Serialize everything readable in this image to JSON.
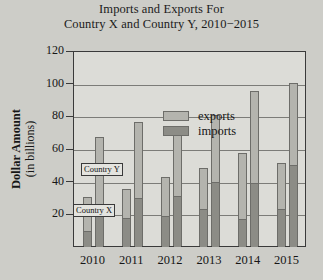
{
  "chart_data": {
    "type": "bar",
    "subtype": "grouped-stacked",
    "title_line1": "Imports and Exports For",
    "title_line2": "Country X and Country Y, 2010−2015",
    "xlabel": "",
    "ylabel": "Dollar Amount (in billions)",
    "ylabel_line1": "Dollar Amount",
    "ylabel_line2": "(in billions)",
    "categories": [
      "2010",
      "2011",
      "2012",
      "2013",
      "2014",
      "2015"
    ],
    "ylim": [
      0,
      120
    ],
    "yticks": [
      20,
      40,
      60,
      80,
      100,
      120
    ],
    "ytick_labels": [
      "20",
      "40",
      "60",
      "80",
      "100",
      "120"
    ],
    "grid": true,
    "legend_position": "upper-left-inside",
    "legend": [
      "exports",
      "imports"
    ],
    "annotations": [
      "Country Y",
      "Country X"
    ],
    "series": [
      {
        "name": "Country X imports",
        "country": "Country X",
        "component": "imports",
        "color": "#8c8c86",
        "values": [
          10,
          18,
          19,
          23,
          17,
          23
        ]
      },
      {
        "name": "Country X exports",
        "country": "Country X",
        "component": "exports",
        "color": "#b4b4ae",
        "values": [
          20,
          17,
          23,
          25,
          40,
          28
        ]
      },
      {
        "name": "Country Y imports",
        "country": "Country Y",
        "component": "imports",
        "color": "#8c8c86",
        "values": [
          25,
          30,
          31,
          40,
          39,
          50
        ]
      },
      {
        "name": "Country Y exports",
        "country": "Country Y",
        "component": "exports",
        "color": "#b4b4ae",
        "values": [
          42,
          46,
          38,
          40,
          56,
          50
        ]
      }
    ],
    "totals": {
      "Country X": [
        30,
        35,
        42,
        48,
        57,
        51
      ],
      "Country Y": [
        67,
        76,
        69,
        80,
        95,
        100
      ]
    }
  },
  "colors": {
    "background": "#cdcdc8",
    "plot_background": "#dcdcd7",
    "exports": "#b4b4ae",
    "imports": "#8c8c86",
    "axis": "#3a3a3a",
    "gridline": "#7c7c78",
    "text": "#161616"
  }
}
